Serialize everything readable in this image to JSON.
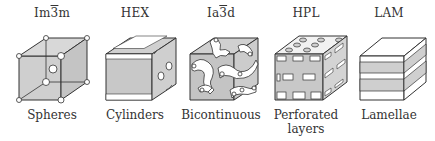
{
  "figure": {
    "title": "",
    "panels": [
      {
        "id": "im3m",
        "symmetry_prefix": "Im",
        "symmetry_bar_digit": "3",
        "symmetry_suffix": "m",
        "symmetry": "Im3̄m",
        "name": "Spheres",
        "name_line2": ""
      },
      {
        "id": "hex",
        "symmetry_prefix": "HEX",
        "symmetry_bar_digit": "",
        "symmetry_suffix": "",
        "symmetry": "HEX",
        "name": "Cylinders",
        "name_line2": ""
      },
      {
        "id": "ia3d",
        "symmetry_prefix": "Ia",
        "symmetry_bar_digit": "3",
        "symmetry_suffix": "d",
        "symmetry": "Ia3̄d",
        "name": "Bicontinuous",
        "name_line2": ""
      },
      {
        "id": "hpl",
        "symmetry_prefix": "HPL",
        "symmetry_bar_digit": "",
        "symmetry_suffix": "",
        "symmetry": "HPL",
        "name": "Perforated",
        "name_line2": "layers"
      },
      {
        "id": "lam",
        "symmetry_prefix": "LAM",
        "symmetry_bar_digit": "",
        "symmetry_suffix": "",
        "symmetry": "LAM",
        "name": "Lamellae",
        "name_line2": ""
      }
    ]
  },
  "colors": {
    "shade": "#c8c8c8",
    "stroke": "#333333",
    "white": "#ffffff"
  }
}
